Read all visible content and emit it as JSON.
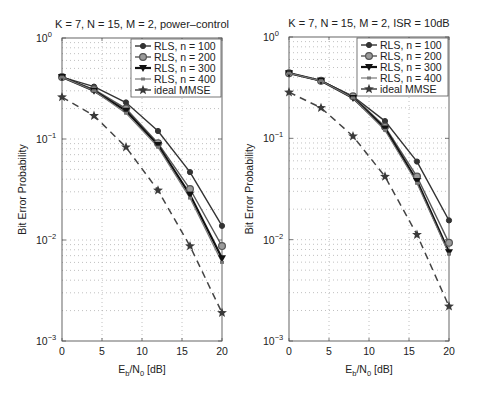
{
  "figure": {
    "width": 477,
    "height": 395
  },
  "chart_data": [
    {
      "type": "line",
      "title": "K = 7, N = 15, M = 2, power–control",
      "xlabel": "Eb/N0 [dB]",
      "ylabel": "Bit Error Probability",
      "xscale": "linear",
      "yscale": "log",
      "xlim": [
        0,
        20
      ],
      "ylim": [
        0.001,
        1
      ],
      "xticks": [
        0,
        5,
        10,
        15,
        20
      ],
      "yticks": [
        "10^-3",
        "10^-2",
        "10^-1",
        "10^0"
      ],
      "grid": true,
      "legend_position": "upper right",
      "x": [
        0,
        4,
        8,
        12,
        16,
        20
      ],
      "series": [
        {
          "name": "RLS, n = 100",
          "marker": "dot",
          "values": [
            0.41,
            0.33,
            0.23,
            0.12,
            0.047,
            0.0138
          ]
        },
        {
          "name": "RLS, n = 200",
          "marker": "circle",
          "values": [
            0.41,
            0.31,
            0.2,
            0.091,
            0.032,
            0.0087
          ]
        },
        {
          "name": "RLS, n = 300",
          "marker": "triangle-down",
          "values": [
            0.41,
            0.3,
            0.19,
            0.087,
            0.028,
            0.0066
          ]
        },
        {
          "name": "RLS, n = 400",
          "marker": "x-small",
          "values": [
            0.41,
            0.3,
            0.18,
            0.083,
            0.026,
            0.006
          ]
        },
        {
          "name": "ideal MMSE",
          "marker": "star",
          "dashed": true,
          "values": [
            0.26,
            0.17,
            0.083,
            0.031,
            0.0087,
            0.0019
          ]
        }
      ]
    },
    {
      "type": "line",
      "title": "K = 7, N = 15, M = 2, ISR = 10dB",
      "xlabel": "Eb/N0 [dB]",
      "ylabel": "Bit Error Probability",
      "xscale": "linear",
      "yscale": "log",
      "xlim": [
        0,
        20
      ],
      "ylim": [
        0.001,
        1
      ],
      "xticks": [
        0,
        5,
        10,
        15,
        20
      ],
      "yticks": [
        "10^-3",
        "10^-2",
        "10^-1",
        "10^0"
      ],
      "grid": true,
      "legend_position": "upper right",
      "x": [
        0,
        4,
        8,
        12,
        16,
        20
      ],
      "series": [
        {
          "name": "RLS, n = 100",
          "marker": "dot",
          "values": [
            0.44,
            0.37,
            0.26,
            0.148,
            0.059,
            0.0155
          ]
        },
        {
          "name": "RLS, n = 200",
          "marker": "circle",
          "values": [
            0.44,
            0.37,
            0.26,
            0.13,
            0.042,
            0.0093
          ]
        },
        {
          "name": "RLS, n = 300",
          "marker": "triangle-down",
          "values": [
            0.44,
            0.37,
            0.25,
            0.125,
            0.038,
            0.0075
          ]
        },
        {
          "name": "RLS, n = 400",
          "marker": "x-small",
          "values": [
            0.44,
            0.37,
            0.25,
            0.12,
            0.036,
            0.0072
          ]
        },
        {
          "name": "ideal MMSE",
          "marker": "star",
          "dashed": true,
          "values": [
            0.285,
            0.2,
            0.105,
            0.042,
            0.0112,
            0.0022
          ]
        }
      ]
    }
  ],
  "layout": {
    "plots": [
      {
        "left": 62,
        "top": 38,
        "right": 222,
        "bottom": 341,
        "legend": {
          "x": 131,
          "y": 39,
          "w": 90,
          "h": 58
        }
      },
      {
        "left": 289,
        "top": 37,
        "right": 449,
        "bottom": 341,
        "legend": {
          "x": 357,
          "y": 38,
          "w": 91,
          "h": 58
        }
      }
    ]
  },
  "colors": {
    "axis": "#555555",
    "grid": "#b0b0b0",
    "series": [
      "#333333",
      "#555555",
      "#111111",
      "#777777",
      "#444444"
    ]
  }
}
